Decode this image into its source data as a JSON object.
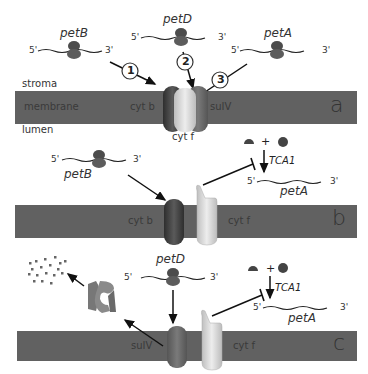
{
  "colors": {
    "membrane": "#616161",
    "ribosome": "#555555",
    "cytb": "#4a4a4a",
    "cytf": "#d8d8d8",
    "suIV": "#6b6b6b",
    "arrow": "#111111"
  },
  "panel_a": {
    "letter": "a",
    "region_labels": {
      "stroma": "stroma",
      "membrane": "membrane",
      "lumen": "lumen"
    },
    "genes": [
      {
        "name": "petB",
        "five": "5'",
        "three": "3'"
      },
      {
        "name": "petD",
        "five": "5'",
        "three": "3'"
      },
      {
        "name": "petA",
        "five": "5'",
        "three": "3'"
      }
    ],
    "steps": [
      "1",
      "2",
      "3"
    ],
    "subunits": {
      "cytb": "cyt b",
      "suIV": "suIV",
      "cytf": "cyt f"
    }
  },
  "panel_b": {
    "letter": "b",
    "gene_left": {
      "name": "petB",
      "five": "5'",
      "three": "3'"
    },
    "regulator": "TCA1",
    "plus": "+",
    "gene_right": {
      "name": "petA",
      "five": "5'",
      "three": "3'"
    },
    "subunits": {
      "cytb": "cyt b",
      "cytf": "cyt f"
    }
  },
  "panel_c": {
    "letter": "c",
    "gene_center": {
      "name": "petD",
      "five": "5'",
      "three": "3'"
    },
    "regulator": "TCA1",
    "plus": "+",
    "gene_right": {
      "name": "petA",
      "five": "5'",
      "three": "3'"
    },
    "subunits": {
      "suIV": "suIV",
      "cytf": "cyt f"
    }
  }
}
